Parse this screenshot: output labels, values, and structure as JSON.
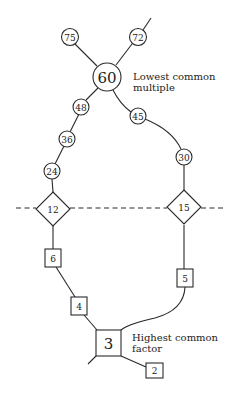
{
  "diagram": {
    "title": "",
    "multiples_chain": {
      "top_node": {
        "label": "60",
        "shape": "circle"
      },
      "caption_line1": "Lowest common",
      "caption_line2": "multiple",
      "branches": [
        {
          "label": "75",
          "shape": "circle"
        },
        {
          "label": "72",
          "shape": "circle"
        }
      ],
      "left_path": [
        {
          "label": "48",
          "shape": "circle"
        },
        {
          "label": "36",
          "shape": "circle"
        },
        {
          "label": "24",
          "shape": "circle"
        }
      ],
      "right_path": [
        {
          "label": "45",
          "shape": "circle"
        },
        {
          "label": "30",
          "shape": "circle"
        }
      ]
    },
    "numbers": [
      {
        "label": "12",
        "shape": "diamond"
      },
      {
        "label": "15",
        "shape": "diamond"
      }
    ],
    "factors_chain": {
      "left_path": [
        {
          "label": "6",
          "shape": "square"
        },
        {
          "label": "4",
          "shape": "square"
        }
      ],
      "right_path": [
        {
          "label": "5",
          "shape": "square"
        }
      ],
      "bottom_node": {
        "label": "3",
        "shape": "square"
      },
      "caption_line1": "Highest common",
      "caption_line2": "factor",
      "branch": {
        "label": "2",
        "shape": "square"
      }
    },
    "colors": {
      "stroke": "#2a2a2a",
      "background": "#ffffff",
      "text": "#222222"
    }
  }
}
